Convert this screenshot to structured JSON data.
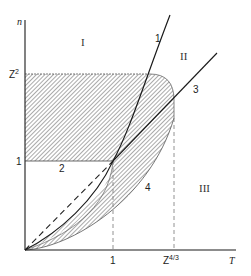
{
  "diagram": {
    "axes": {
      "x_label": "T",
      "y_label": "n",
      "x_ticks": [
        {
          "label": "1"
        },
        {
          "label": "Z",
          "sup": "4/3"
        }
      ],
      "y_ticks": [
        {
          "label": "1"
        },
        {
          "label": "Z",
          "sup": "2"
        }
      ]
    },
    "regions": {
      "I": "I",
      "II": "II",
      "III": "III"
    },
    "curves": {
      "c1": "1",
      "c2": "2",
      "c3": "3",
      "c4": "4"
    },
    "colors": {
      "line": "#1a1a1a",
      "hatch": "#555555",
      "dashed_guide": "#777777"
    }
  }
}
